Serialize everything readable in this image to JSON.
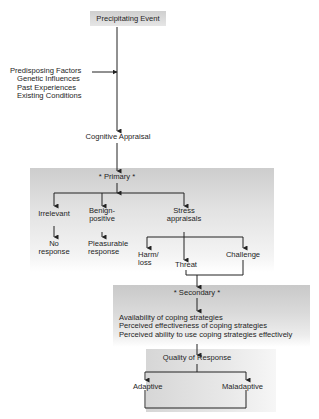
{
  "diagram": {
    "top": {
      "label": "Precipitating Event"
    },
    "factors": {
      "title": "Predisposing Factors",
      "items": [
        "Genetic Influences",
        "Past Experiences",
        "Existing Conditions"
      ]
    },
    "appraisal": {
      "label": "Cognitive Appraisal"
    },
    "primary": {
      "label": "* Primary *",
      "branches": [
        {
          "label": "Irrelevant",
          "result": "No response"
        },
        {
          "label": "Benign-positive",
          "result": "Pleasurable response"
        },
        {
          "label": "Stress appraisals"
        }
      ],
      "stress_types": [
        "Harm/ loss",
        "Threat",
        "Challenge"
      ]
    },
    "secondary": {
      "label": "* Secondary *",
      "items": [
        "Availability of coping strategies",
        "Perceived effectiveness of coping strategies",
        "Perceived ability to use coping strategies effectively"
      ]
    },
    "quality": {
      "label": "Quality of Response",
      "outcomes": [
        "Adaptive",
        "Maladaptive"
      ]
    }
  }
}
